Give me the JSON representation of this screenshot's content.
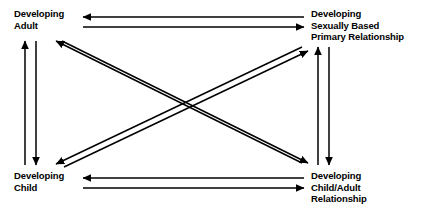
{
  "diagram": {
    "stroke_color": "#000000",
    "background_color": "#ffffff",
    "nodes": [
      {
        "id": "developing-adult",
        "label": "Developing\nAdult",
        "position": "top-left"
      },
      {
        "id": "sexual-relationship",
        "label": "Developing\nSexually Based\nPrimary Relationship",
        "position": "top-right"
      },
      {
        "id": "developing-child",
        "label": "Developing\nChild",
        "position": "bottom-left"
      },
      {
        "id": "child-adult-relationship",
        "label": "Developing\nChild/Adult\nRelationship",
        "position": "bottom-right"
      }
    ],
    "edges": [
      {
        "id": "top-pair",
        "from": "developing-adult",
        "to": "sexual-relationship",
        "style": "double-line",
        "direction": "bidirectional"
      },
      {
        "id": "bottom-pair",
        "from": "developing-child",
        "to": "child-adult-relationship",
        "style": "double-line",
        "direction": "bidirectional"
      },
      {
        "id": "left-pair",
        "from": "developing-adult",
        "to": "developing-child",
        "style": "double-line",
        "direction": "bidirectional"
      },
      {
        "id": "right-pair",
        "from": "sexual-relationship",
        "to": "child-adult-relationship",
        "style": "double-line",
        "direction": "bidirectional"
      },
      {
        "id": "diagonal-nwse-pair",
        "from": "developing-adult",
        "to": "child-adult-relationship",
        "style": "double-line",
        "direction": "bidirectional"
      },
      {
        "id": "diagonal-swne-pair",
        "from": "developing-child",
        "to": "sexual-relationship",
        "style": "double-line",
        "direction": "bidirectional"
      }
    ]
  }
}
